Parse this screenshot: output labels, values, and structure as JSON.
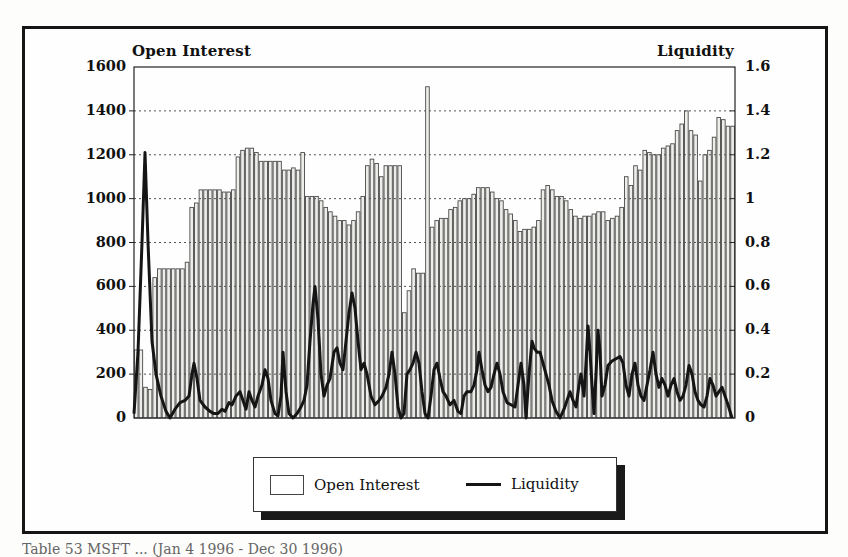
{
  "chart_data": {
    "type": "bar",
    "title": "",
    "left_axis_title": "Open Interest",
    "right_axis_title": "Liquidity",
    "left_ylim": [
      0,
      1600
    ],
    "left_ticks": [
      "1600",
      "1400",
      "1200",
      "1000",
      "800",
      "600",
      "400",
      "200",
      "0"
    ],
    "right_ylim": [
      0,
      1.6
    ],
    "right_ticks": [
      "1.6",
      "1.4",
      "1.2",
      "1",
      "0.8",
      "0.6",
      "0.4",
      "0.2",
      "0"
    ],
    "grid": "horizontal dotted",
    "legend_position": "bottom",
    "series": [
      {
        "name": "Open Interest",
        "type": "bar",
        "axis": "left",
        "values": [
          310,
          310,
          140,
          130,
          640,
          680,
          680,
          680,
          680,
          680,
          680,
          710,
          960,
          980,
          1040,
          1040,
          1040,
          1040,
          1040,
          1030,
          1030,
          1040,
          1190,
          1220,
          1230,
          1230,
          1210,
          1170,
          1170,
          1170,
          1170,
          1170,
          1130,
          1130,
          1140,
          1130,
          1210,
          1010,
          1010,
          1010,
          990,
          960,
          940,
          920,
          900,
          900,
          880,
          900,
          940,
          1010,
          1150,
          1180,
          1160,
          1100,
          1150,
          1150,
          1150,
          1150,
          480,
          580,
          680,
          660,
          660,
          1510,
          870,
          900,
          910,
          910,
          950,
          960,
          990,
          1000,
          1000,
          1020,
          1050,
          1050,
          1050,
          1030,
          1000,
          990,
          950,
          930,
          900,
          850,
          860,
          860,
          870,
          900,
          1040,
          1060,
          1040,
          1010,
          1010,
          990,
          950,
          920,
          910,
          920,
          920,
          930,
          940,
          940,
          900,
          910,
          920,
          960,
          1100,
          1060,
          1150,
          1130,
          1220,
          1210,
          1200,
          1200,
          1230,
          1240,
          1250,
          1310,
          1340,
          1400,
          1310,
          1290,
          1080,
          1200,
          1220,
          1280,
          1370,
          1360,
          1330,
          1330
        ]
      },
      {
        "name": "Liquidity",
        "type": "line",
        "axis": "right",
        "points": [
          [
            0,
            0.02
          ],
          [
            4,
            0.3
          ],
          [
            8,
            0.8
          ],
          [
            11,
            1.21
          ],
          [
            14,
            0.8
          ],
          [
            18,
            0.35
          ],
          [
            22,
            0.2
          ],
          [
            27,
            0.1
          ],
          [
            32,
            0.03
          ],
          [
            36,
            0.0
          ],
          [
            41,
            0.04
          ],
          [
            46,
            0.07
          ],
          [
            51,
            0.08
          ],
          [
            55,
            0.1
          ],
          [
            58,
            0.2
          ],
          [
            60,
            0.25
          ],
          [
            63,
            0.18
          ],
          [
            66,
            0.08
          ],
          [
            71,
            0.05
          ],
          [
            76,
            0.03
          ],
          [
            80,
            0.02
          ],
          [
            84,
            0.02
          ],
          [
            88,
            0.04
          ],
          [
            91,
            0.03
          ],
          [
            95,
            0.07
          ],
          [
            98,
            0.06
          ],
          [
            102,
            0.1
          ],
          [
            106,
            0.12
          ],
          [
            109,
            0.08
          ],
          [
            112,
            0.04
          ],
          [
            115,
            0.12
          ],
          [
            118,
            0.08
          ],
          [
            121,
            0.05
          ],
          [
            124,
            0.1
          ],
          [
            128,
            0.15
          ],
          [
            131,
            0.22
          ],
          [
            134,
            0.18
          ],
          [
            137,
            0.08
          ],
          [
            141,
            0.02
          ],
          [
            144,
            0.01
          ],
          [
            147,
            0.1
          ],
          [
            149,
            0.3
          ],
          [
            152,
            0.12
          ],
          [
            155,
            0.02
          ],
          [
            159,
            0.0
          ],
          [
            163,
            0.02
          ],
          [
            167,
            0.05
          ],
          [
            170,
            0.08
          ],
          [
            173,
            0.15
          ],
          [
            176,
            0.35
          ],
          [
            179,
            0.52
          ],
          [
            181,
            0.6
          ],
          [
            184,
            0.45
          ],
          [
            187,
            0.2
          ],
          [
            190,
            0.1
          ],
          [
            193,
            0.15
          ],
          [
            196,
            0.18
          ],
          [
            200,
            0.3
          ],
          [
            203,
            0.32
          ],
          [
            206,
            0.25
          ],
          [
            209,
            0.22
          ],
          [
            212,
            0.35
          ],
          [
            215,
            0.48
          ],
          [
            218,
            0.57
          ],
          [
            221,
            0.5
          ],
          [
            224,
            0.35
          ],
          [
            227,
            0.22
          ],
          [
            230,
            0.25
          ],
          [
            233,
            0.2
          ],
          [
            237,
            0.1
          ],
          [
            241,
            0.06
          ],
          [
            245,
            0.08
          ],
          [
            248,
            0.1
          ],
          [
            252,
            0.14
          ],
          [
            255,
            0.2
          ],
          [
            258,
            0.3
          ],
          [
            261,
            0.2
          ],
          [
            264,
            0.05
          ],
          [
            267,
            0.0
          ],
          [
            270,
            0.02
          ],
          [
            273,
            0.2
          ],
          [
            276,
            0.22
          ],
          [
            279,
            0.25
          ],
          [
            282,
            0.3
          ],
          [
            285,
            0.25
          ],
          [
            288,
            0.12
          ],
          [
            291,
            0.02
          ],
          [
            294,
            0.0
          ],
          [
            297,
            0.1
          ],
          [
            300,
            0.22
          ],
          [
            303,
            0.25
          ],
          [
            306,
            0.18
          ],
          [
            309,
            0.12
          ],
          [
            312,
            0.1
          ],
          [
            316,
            0.06
          ],
          [
            320,
            0.08
          ],
          [
            324,
            0.03
          ],
          [
            327,
            0.02
          ],
          [
            330,
            0.1
          ],
          [
            333,
            0.12
          ],
          [
            337,
            0.12
          ],
          [
            340,
            0.15
          ],
          [
            343,
            0.22
          ],
          [
            345,
            0.3
          ],
          [
            348,
            0.22
          ],
          [
            351,
            0.15
          ],
          [
            354,
            0.12
          ],
          [
            357,
            0.14
          ],
          [
            360,
            0.2
          ],
          [
            363,
            0.25
          ],
          [
            366,
            0.2
          ],
          [
            369,
            0.12
          ],
          [
            373,
            0.07
          ],
          [
            377,
            0.06
          ],
          [
            381,
            0.05
          ],
          [
            384,
            0.15
          ],
          [
            387,
            0.25
          ],
          [
            390,
            0.15
          ],
          [
            392,
            0.0
          ],
          [
            395,
            0.2
          ],
          [
            398,
            0.35
          ],
          [
            400,
            0.32
          ],
          [
            403,
            0.3
          ],
          [
            406,
            0.3
          ],
          [
            409,
            0.25
          ],
          [
            412,
            0.2
          ],
          [
            415,
            0.15
          ],
          [
            418,
            0.08
          ],
          [
            422,
            0.03
          ],
          [
            426,
            0.0
          ],
          [
            430,
            0.04
          ],
          [
            433,
            0.08
          ],
          [
            436,
            0.12
          ],
          [
            439,
            0.08
          ],
          [
            442,
            0.05
          ],
          [
            445,
            0.15
          ],
          [
            447,
            0.2
          ],
          [
            450,
            0.1
          ],
          [
            452,
            0.25
          ],
          [
            454,
            0.42
          ],
          [
            456,
            0.3
          ],
          [
            458,
            0.15
          ],
          [
            460,
            0.02
          ],
          [
            462,
            0.2
          ],
          [
            464,
            0.4
          ],
          [
            466,
            0.3
          ],
          [
            468,
            0.1
          ],
          [
            471,
            0.15
          ],
          [
            474,
            0.24
          ],
          [
            478,
            0.26
          ],
          [
            482,
            0.27
          ],
          [
            486,
            0.28
          ],
          [
            489,
            0.25
          ],
          [
            492,
            0.15
          ],
          [
            495,
            0.1
          ],
          [
            498,
            0.2
          ],
          [
            501,
            0.25
          ],
          [
            504,
            0.15
          ],
          [
            507,
            0.1
          ],
          [
            510,
            0.08
          ],
          [
            513,
            0.15
          ],
          [
            516,
            0.22
          ],
          [
            519,
            0.3
          ],
          [
            522,
            0.2
          ],
          [
            525,
            0.14
          ],
          [
            528,
            0.18
          ],
          [
            531,
            0.15
          ],
          [
            534,
            0.1
          ],
          [
            537,
            0.15
          ],
          [
            540,
            0.18
          ],
          [
            543,
            0.12
          ],
          [
            546,
            0.08
          ],
          [
            549,
            0.1
          ],
          [
            552,
            0.15
          ],
          [
            555,
            0.24
          ],
          [
            558,
            0.2
          ],
          [
            561,
            0.12
          ],
          [
            564,
            0.08
          ],
          [
            567,
            0.06
          ],
          [
            570,
            0.05
          ],
          [
            573,
            0.1
          ],
          [
            576,
            0.18
          ],
          [
            579,
            0.15
          ],
          [
            582,
            0.1
          ],
          [
            585,
            0.12
          ],
          [
            588,
            0.14
          ],
          [
            591,
            0.1
          ],
          [
            594,
            0.06
          ],
          [
            598,
            0.0
          ]
        ]
      }
    ]
  },
  "legend": {
    "items": [
      {
        "label": "Open Interest",
        "symbol": "box"
      },
      {
        "label": "Liquidity",
        "symbol": "line"
      }
    ]
  },
  "caption": "Table 53 MSFT ... (Jan 4 1996 - Dec 30 1996)",
  "colors": {
    "bar_fill": "#ededea",
    "bar_stroke": "#4a4a4a",
    "line": "#151515",
    "grid": "#555555"
  }
}
